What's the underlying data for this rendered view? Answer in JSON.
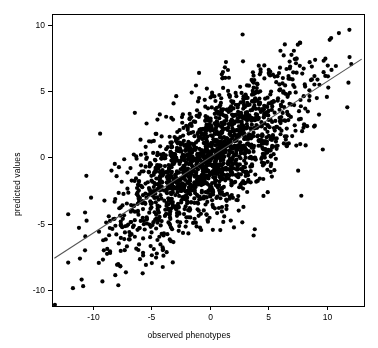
{
  "chart_data": {
    "type": "scatter",
    "title": "",
    "xlabel": "observed phenotypes",
    "ylabel": "predicted values",
    "xlim": [
      -13.5,
      13.2
    ],
    "ylim": [
      -11.2,
      10.8
    ],
    "xticks": [
      -10,
      -5,
      0,
      5,
      10
    ],
    "yticks": [
      -10,
      -5,
      0,
      5,
      10
    ],
    "xtick_labels": [
      "-10",
      "-5",
      "0",
      "5",
      "10"
    ],
    "ytick_labels": [
      "-10",
      "-5",
      "0",
      "5",
      "10"
    ],
    "grid": false,
    "legend": null,
    "point_color": "#000000",
    "point_size": 2.1,
    "n_points": 1800,
    "correlation": 0.72,
    "series": [
      {
        "name": "observations",
        "marker": "filled-circle",
        "x_mean": 0.0,
        "x_sd": 4.0,
        "y_mean": 0.0,
        "y_sd": 3.2
      }
    ],
    "fit_line": {
      "name": "regression-line",
      "color": "#555555",
      "width": 1.1,
      "slope": 0.57,
      "intercept": 0.0,
      "x_start": -13.3,
      "y_start": -7.6,
      "x_end": 13.0,
      "y_end": 7.4
    }
  }
}
